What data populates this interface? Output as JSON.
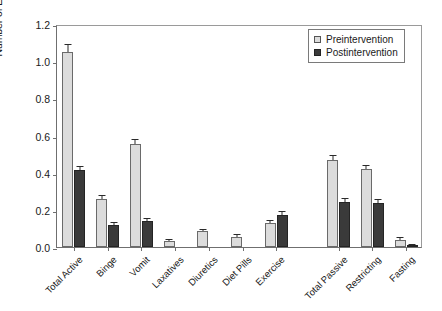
{
  "chart_data": {
    "type": "bar",
    "title": "",
    "xlabel": "",
    "ylabel": "Number of ED Behaviors/Day",
    "ylim": [
      0.0,
      1.2
    ],
    "yticks": [
      "0.0",
      "0.2",
      "0.4",
      "0.6",
      "0.8",
      "1.0",
      "1.2"
    ],
    "ytick_values": [
      0.0,
      0.2,
      0.4,
      0.6,
      0.8,
      1.0,
      1.2
    ],
    "grid": false,
    "legend_position": "top-right",
    "categories": [
      "Total Active",
      "Binge",
      "Vomit",
      "Laxatives",
      "Diuretics",
      "Diet Pills",
      "Exercise",
      "Total Passive",
      "Restricting",
      "Fasting"
    ],
    "group_break_after": "Exercise",
    "series": [
      {
        "name": "Preintervention",
        "color": "#dcdcdc",
        "values": [
          1.05,
          0.26,
          0.555,
          0.03,
          0.085,
          0.055,
          0.13,
          0.47,
          0.42,
          0.04
        ],
        "errors": [
          0.035,
          0.012,
          0.022,
          0.006,
          0.009,
          0.008,
          0.012,
          0.02,
          0.018,
          0.007
        ]
      },
      {
        "name": "Postintervention",
        "color": "#3a3a3a",
        "values": [
          0.415,
          0.12,
          0.14,
          0.0,
          0.0,
          0.0,
          0.17,
          0.24,
          0.235,
          0.008
        ],
        "errors": [
          0.018,
          0.01,
          0.012,
          0.0,
          0.0,
          0.0,
          0.02,
          0.018,
          0.02,
          0.004
        ]
      }
    ]
  },
  "legend": {
    "items": [
      {
        "label": "Preintervention",
        "swatch": "pre"
      },
      {
        "label": "Postintervention",
        "swatch": "post"
      }
    ]
  }
}
